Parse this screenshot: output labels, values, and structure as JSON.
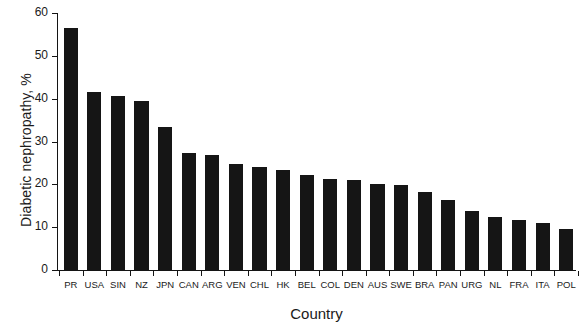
{
  "chart_data": {
    "type": "bar",
    "title": "",
    "xlabel": "Country",
    "ylabel": "Diabetic nephropathy, %",
    "ylim": [
      0,
      60
    ],
    "yticks": [
      0,
      10,
      20,
      30,
      40,
      50,
      60
    ],
    "grid": false,
    "legend": false,
    "bar_color": "#151515",
    "categories": [
      "PR",
      "USA",
      "SIN",
      "NZ",
      "JPN",
      "CAN",
      "ARG",
      "VEN",
      "CHL",
      "HK",
      "BEL",
      "COL",
      "DEN",
      "AUS",
      "SWE",
      "BRA",
      "PAN",
      "URG",
      "NL",
      "FRA",
      "ITA",
      "POL"
    ],
    "values": [
      56.5,
      41.5,
      40.7,
      39.5,
      33.5,
      27.3,
      26.8,
      24.8,
      24.0,
      23.4,
      22.1,
      21.2,
      21.0,
      20.1,
      19.9,
      18.1,
      16.3,
      13.7,
      12.4,
      11.7,
      11.0,
      9.6
    ]
  }
}
